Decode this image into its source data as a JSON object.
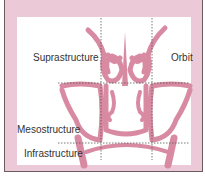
{
  "diagram": {
    "type": "anatomical schematic - coronal section of paranasal sinuses with regional divisions",
    "labels": {
      "suprastructure": "Suprastructure",
      "orbit": "Orbit",
      "mesostructure": "Mesostructure",
      "infrastructure": "Infrastructure"
    },
    "colors": {
      "frame": "#ebc9d6",
      "panel": "#ffffff",
      "structure": "#d98aa3",
      "border": "#6b5a60",
      "dashed_line": "#555555",
      "text": "#333333"
    }
  }
}
